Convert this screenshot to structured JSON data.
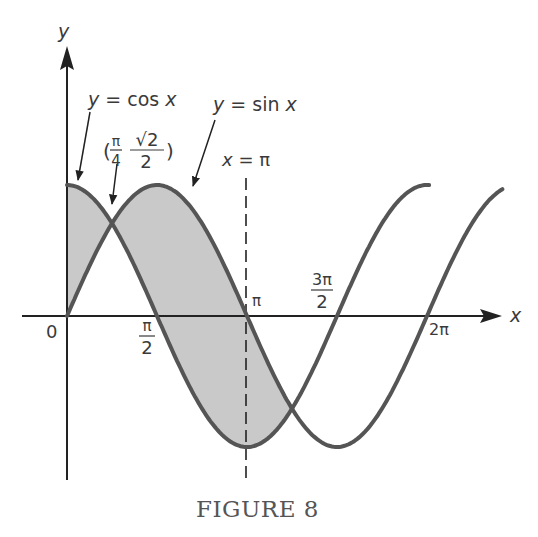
{
  "chart_data": {
    "type": "line",
    "title": "",
    "caption": "FIGURE 8",
    "xlabel": "x",
    "ylabel": "y",
    "grid": false,
    "legend": "none (curves labeled with arrows)",
    "xlim": [
      0,
      7.6
    ],
    "ylim": [
      -1.3,
      2.1
    ],
    "x_ticks": [
      {
        "value": 0,
        "label": "0"
      },
      {
        "value": 1.5708,
        "label": "π/2",
        "num": "π",
        "den": "2"
      },
      {
        "value": 3.1416,
        "label": "π"
      },
      {
        "value": 4.7124,
        "label": "3π/2",
        "num": "3π",
        "den": "2"
      },
      {
        "value": 6.2832,
        "label": "2π"
      }
    ],
    "series": [
      {
        "name": "y = cos x",
        "function": "cos",
        "x_start": 0,
        "x_end": 6.32,
        "color": "#555555"
      },
      {
        "name": "y = sin x",
        "function": "sin",
        "x_start": 0,
        "x_end": 7.6,
        "color": "#555555"
      }
    ],
    "shaded_region": {
      "between": [
        "cos",
        "sin"
      ],
      "x_start": 0,
      "x_end": 3.927,
      "color": "#c9c9c9"
    },
    "vertical_line": {
      "x": 3.1416,
      "label": "x = π",
      "style": "dashed"
    },
    "annotations": [
      {
        "text": "y = cos x",
        "points_to": "cos curve near x = 0"
      },
      {
        "text": "y = sin x",
        "points_to": "sin curve near x = 2.2"
      },
      {
        "text": "(π/4, √2/2)",
        "points_to": "intersection",
        "x": 0.7854,
        "y": 0.7071
      }
    ]
  },
  "labels": {
    "y_axis": "y",
    "x_axis": "x",
    "cos_label": "y = cos x",
    "sin_label": "y = sin x",
    "vline_label": "x = π",
    "point_open": "(",
    "point_close": ")",
    "point_x_num": "π",
    "point_x_den": "4",
    "point_y_num": "√2",
    "point_y_den": "2",
    "origin": "0",
    "pi": "π",
    "two_pi": "2π",
    "half_pi_num": "π",
    "half_pi_den": "2",
    "three_half_pi_num": "3π",
    "three_half_pi_den": "2"
  }
}
